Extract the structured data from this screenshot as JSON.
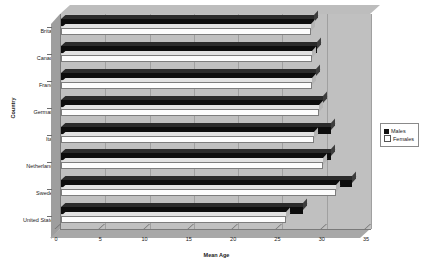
{
  "chart_data": {
    "type": "bar",
    "orientation": "horizontal",
    "title": "",
    "xlabel": "Mean Age",
    "ylabel": "Country",
    "xlim": [
      0,
      35
    ],
    "xticks": [
      0,
      5,
      10,
      15,
      20,
      25,
      30,
      35
    ],
    "grid": true,
    "legend_position": "right",
    "categories": [
      "Britain",
      "Canada",
      "France",
      "Germany",
      "Italy",
      "Netherlands",
      "Sweden",
      "United States"
    ],
    "series": [
      {
        "name": "Males",
        "color": "#111111",
        "values": [
          28.6,
          28.9,
          28.8,
          29.6,
          30.5,
          30.5,
          32.9,
          27.3
        ]
      },
      {
        "name": "Females",
        "color": "#ffffff",
        "values": [
          28.2,
          28.3,
          28.3,
          29.1,
          28.6,
          29.6,
          31.1,
          25.4
        ]
      }
    ]
  },
  "legend": {
    "entries": [
      {
        "label": "Males",
        "marker": "filled-square-icon"
      },
      {
        "label": "Females",
        "marker": "hollow-square-icon"
      }
    ]
  },
  "axes": {
    "x_title": "Mean Age",
    "y_title": "Country",
    "x_tick_labels": [
      "0",
      "5",
      "10",
      "15",
      "20",
      "25",
      "30",
      "35"
    ],
    "y_tick_labels": [
      "Britain",
      "Canada",
      "France",
      "Germany",
      "Italy",
      "Netherlands",
      "Sweden",
      "United States"
    ]
  },
  "colors": {
    "plot_background": "#c0c0c0",
    "wall_top": "#bdbdbd",
    "wall_left": "#9e9e9e",
    "floor": "#a8a8a8",
    "gridline": "#a0a0a0",
    "males": "#111111",
    "females": "#ffffff",
    "text": "#1a1a1a"
  }
}
